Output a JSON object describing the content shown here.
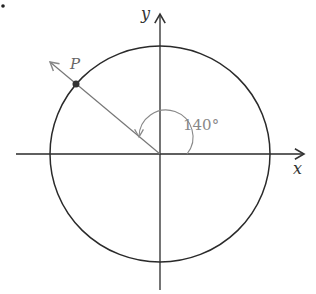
{
  "figure": {
    "bullet": ".",
    "x_axis_label": "x",
    "y_axis_label": "y",
    "point_label": "P",
    "angle_label": "140°",
    "angle_degrees": 140,
    "colors": {
      "line": "#2a2a2a",
      "ray": "#777777",
      "text": "#333333",
      "angle_text": "#888888"
    }
  }
}
